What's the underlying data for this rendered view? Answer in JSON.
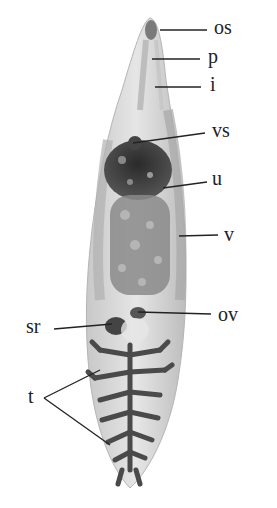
{
  "figure": {
    "labels": [
      {
        "id": "os",
        "text": "os",
        "x": 214,
        "y": 17
      },
      {
        "id": "p",
        "text": "p",
        "x": 210,
        "y": 46
      },
      {
        "id": "i",
        "text": "i",
        "x": 210,
        "y": 76
      },
      {
        "id": "vs",
        "text": "vs",
        "x": 213,
        "y": 124
      },
      {
        "id": "u",
        "text": "u",
        "x": 210,
        "y": 168
      },
      {
        "id": "v",
        "text": "v",
        "x": 226,
        "y": 229
      },
      {
        "id": "ov",
        "text": "ov",
        "x": 218,
        "y": 310
      },
      {
        "id": "sr",
        "text": "sr",
        "x": 26,
        "y": 318
      },
      {
        "id": "t",
        "text": "t",
        "x": 27,
        "y": 389
      }
    ],
    "colors": {
      "background": "#ffffff",
      "body_light": "#d8d8d8",
      "body_mid": "#9a9a9a",
      "body_dark": "#3a3a3a",
      "leader_line": "#222222"
    }
  }
}
